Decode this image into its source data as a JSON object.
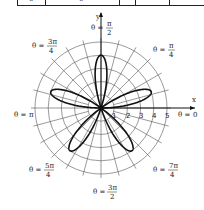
{
  "table_fragment": {
    "visible_values": [
      "0",
      "0"
    ]
  },
  "diagram": {
    "type": "polar_rose",
    "equation_implied": "r = 4 sin(5θ)",
    "petals": 5,
    "petal_length": 4,
    "center_px": [
      101,
      108
    ],
    "unit_px": 13.2,
    "rings": [
      1,
      2,
      3,
      4,
      5
    ],
    "radial_step_deg": 15,
    "axis_labels": {
      "x": "x",
      "y": "y"
    },
    "tick_labels": [
      "1",
      "2",
      "3",
      "4",
      "5"
    ],
    "angle_labels": [
      {
        "id": "zero",
        "prefix": "θ = ",
        "num": "0",
        "den": ""
      },
      {
        "id": "pi_over_4",
        "prefix": "θ = ",
        "num": "π",
        "den": "4"
      },
      {
        "id": "pi_over_2",
        "prefix": "θ = ",
        "num": "π",
        "den": "2"
      },
      {
        "id": "three_pi_over_4",
        "prefix": "θ = ",
        "num": "3π",
        "den": "4"
      },
      {
        "id": "pi",
        "prefix": "θ = ",
        "num": "π",
        "den": ""
      },
      {
        "id": "five_pi_over_4",
        "prefix": "θ = ",
        "num": "5π",
        "den": "4"
      },
      {
        "id": "three_pi_over_2",
        "prefix": "θ = ",
        "num": "3π",
        "den": "2"
      },
      {
        "id": "seven_pi_over_4",
        "prefix": "θ = ",
        "num": "7π",
        "den": "4"
      }
    ],
    "colors": {
      "grid": "#555555",
      "curve": "#111111",
      "axis": "#111111"
    }
  }
}
